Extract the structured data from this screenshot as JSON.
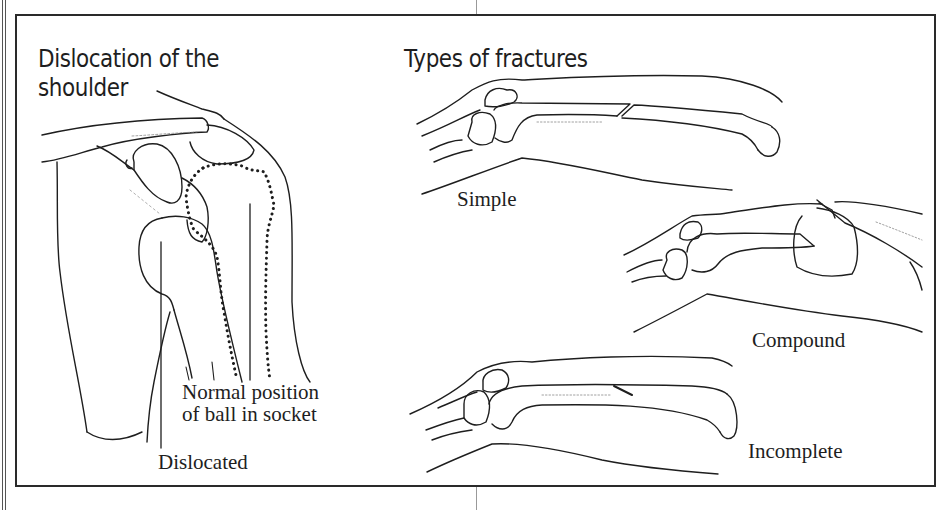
{
  "figure": {
    "left_panel": {
      "title_line1": "Dislocation of the",
      "title_line2": "shoulder",
      "labels": {
        "normal_position_line1": "Normal position",
        "normal_position_line2": "of ball in socket",
        "dislocated": "Dislocated"
      }
    },
    "right_panel": {
      "title": "Types of fractures",
      "fracture_types": [
        {
          "label": "Simple"
        },
        {
          "label": "Compound"
        },
        {
          "label": "Incomplete"
        }
      ]
    }
  },
  "colors": {
    "ink": "#1e1e1e",
    "frame": "#2a2a2a",
    "background": "#ffffff"
  }
}
